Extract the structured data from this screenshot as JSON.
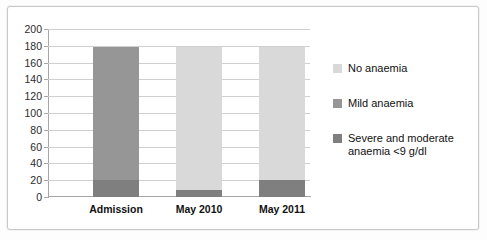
{
  "chart_data": {
    "type": "bar",
    "subtype": "stacked-bar",
    "title": "",
    "xlabel": "",
    "ylabel": "",
    "ylim": [
      0,
      200
    ],
    "ytick_step": 20,
    "yticks": [
      200,
      180,
      160,
      140,
      120,
      100,
      80,
      60,
      40,
      20,
      0
    ],
    "grid": true,
    "legend_position": "right",
    "categories": [
      "Admission",
      "May 2010",
      "May 2011"
    ],
    "series": [
      {
        "name": "Severe and moderate anaemia <9 g/dl",
        "color": "#7f7f7f",
        "values": [
          20,
          8,
          20
        ]
      },
      {
        "name": "Mild anaemia",
        "color": "#969696",
        "values": [
          158,
          0,
          0
        ]
      },
      {
        "name": "No anaemia",
        "color": "#d9d9d9",
        "values": [
          0,
          170,
          158
        ]
      }
    ],
    "totals": [
      178,
      178,
      178
    ]
  },
  "legend": {
    "items": [
      {
        "label": "No anaemia",
        "color": "#d9d9d9"
      },
      {
        "label": "Mild anaemia",
        "color": "#969696"
      },
      {
        "label": "Severe and moderate anaemia <9 g/dl",
        "color": "#7f7f7f"
      }
    ]
  }
}
